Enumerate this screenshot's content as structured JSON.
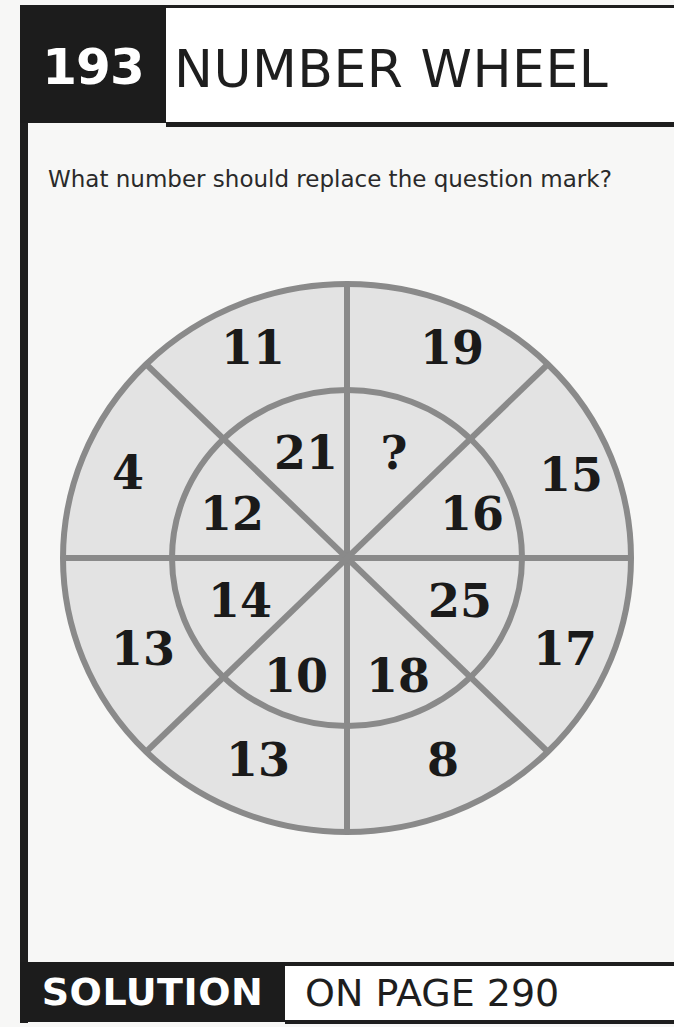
{
  "header": {
    "puzzle_number": "193",
    "title": "NUMBER WHEEL"
  },
  "question": "What number should replace the question mark?",
  "wheel": {
    "colors": {
      "fill": "#e3e3e3",
      "lines": "#8a8a8a",
      "text": "#1a1a1a"
    },
    "outer_ring": [
      {
        "position": "top-left",
        "value": "11"
      },
      {
        "position": "top-right",
        "value": "19"
      },
      {
        "position": "right-upper",
        "value": "15"
      },
      {
        "position": "right-lower",
        "value": "17"
      },
      {
        "position": "bottom-right",
        "value": "8"
      },
      {
        "position": "bottom-left",
        "value": "13"
      },
      {
        "position": "left-lower",
        "value": "13"
      },
      {
        "position": "left-upper",
        "value": "4"
      }
    ],
    "inner_ring": [
      {
        "position": "top-left",
        "value": "21"
      },
      {
        "position": "top-right",
        "value": "?"
      },
      {
        "position": "right-upper",
        "value": "16"
      },
      {
        "position": "right-lower",
        "value": "25"
      },
      {
        "position": "bottom-right",
        "value": "18"
      },
      {
        "position": "bottom-left",
        "value": "10"
      },
      {
        "position": "left-lower",
        "value": "14"
      },
      {
        "position": "left-upper",
        "value": "12"
      }
    ]
  },
  "footer": {
    "label": "SOLUTION",
    "page_ref": "ON PAGE 290"
  }
}
